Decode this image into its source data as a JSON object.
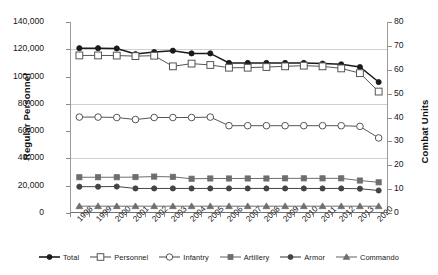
{
  "chart_data": {
    "type": "line",
    "title": "",
    "xlabel": "",
    "ylabel": "Regular Personnel",
    "y2label": "Combat Units",
    "ylim": [
      0,
      140000
    ],
    "y2lim": [
      0,
      80
    ],
    "ytick_labels": [
      "140,000",
      "120,000",
      "100,000",
      "80,000",
      "60,000",
      "40,000",
      "20,000",
      "0"
    ],
    "ytick_values": [
      140000,
      120000,
      100000,
      80000,
      60000,
      40000,
      20000,
      0
    ],
    "y2tick_labels": [
      "80",
      "70",
      "60",
      "50",
      "40",
      "30",
      "20",
      "10",
      "0"
    ],
    "y2tick_values": [
      80,
      70,
      60,
      50,
      40,
      30,
      20,
      10,
      0
    ],
    "gridlines": [
      120000,
      80000,
      40000
    ],
    "grid": true,
    "legend_position": "bottom",
    "categories": [
      "1998",
      "1999",
      "2000",
      "2001",
      "2002",
      "2003",
      "2004",
      "2005",
      "2006",
      "2007",
      "2008",
      "2009",
      "2010",
      "2011",
      "2012",
      "2013",
      "2020"
    ],
    "series": [
      {
        "name": "Total",
        "axis": "left",
        "marker": "filled-circle",
        "color": "#1a1a1a",
        "values": [
          120800,
          120800,
          120600,
          116500,
          118000,
          119000,
          117000,
          117000,
          110000,
          110000,
          110000,
          110000,
          110000,
          109500,
          109000,
          107000,
          96000
        ]
      },
      {
        "name": "Personnel",
        "axis": "left",
        "marker": "open-square",
        "color": "#555555",
        "values": [
          115500,
          115500,
          115400,
          115000,
          115300,
          107500,
          109500,
          108500,
          106500,
          106500,
          107000,
          107500,
          108000,
          107500,
          106000,
          102500,
          89000
        ]
      },
      {
        "name": "Infantry",
        "axis": "left",
        "marker": "open-circle",
        "color": "#555555",
        "values": [
          70300,
          70300,
          70000,
          68500,
          70000,
          70000,
          70000,
          70300,
          64000,
          64000,
          64000,
          64000,
          64000,
          64000,
          64000,
          63500,
          55000
        ]
      },
      {
        "name": "Artillery",
        "axis": "left",
        "marker": "filled-square",
        "color": "#6e6e6e",
        "values": [
          26200,
          26200,
          26200,
          26300,
          26700,
          26500,
          25100,
          25300,
          25300,
          25300,
          25300,
          25400,
          25400,
          25400,
          25400,
          23800,
          22500
        ]
      },
      {
        "name": "Armor",
        "axis": "left",
        "marker": "filled-circle",
        "color": "#444444",
        "values": [
          19300,
          19300,
          19400,
          18000,
          18000,
          18000,
          18000,
          18000,
          18000,
          18000,
          18000,
          18000,
          18000,
          18000,
          18000,
          17800,
          16500
        ]
      },
      {
        "name": "Commando",
        "axis": "left",
        "marker": "filled-triangle",
        "color": "#6e6e6e",
        "values": [
          5000,
          5000,
          5000,
          5000,
          5000,
          5000,
          5000,
          5000,
          5000,
          5000,
          5000,
          5000,
          5000,
          5000,
          5000,
          5000,
          5000
        ]
      }
    ]
  },
  "legend": {
    "items": [
      {
        "label": "Total"
      },
      {
        "label": "Personnel"
      },
      {
        "label": "Infantry"
      },
      {
        "label": "Artillery"
      },
      {
        "label": "Armor"
      },
      {
        "label": "Commando"
      }
    ]
  }
}
